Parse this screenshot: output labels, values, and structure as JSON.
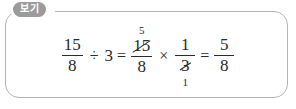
{
  "box": {
    "label": "보기",
    "border_color": "#b4b4b4",
    "badge_color": "#9b9b9b",
    "badge_text_color": "#ffffff",
    "background": "#ffffff"
  },
  "equation": {
    "full_text": "15/8 ÷ 3 = 15/8 × 1/3 = 5/8",
    "text_color": "#2b2b2b",
    "terms": {
      "f1": {
        "numerator": "15",
        "denominator": "8"
      },
      "op_divide": "÷",
      "divisor": "3",
      "op_equals_1": "=",
      "f2": {
        "numerator": "15",
        "denominator": "8",
        "cancel_numerator": true,
        "cancel_value_above": "5"
      },
      "op_multiply": "×",
      "f3": {
        "numerator": "1",
        "denominator": "3",
        "cancel_denominator": true,
        "cancel_value_below": "1"
      },
      "op_equals_2": "=",
      "f4": {
        "numerator": "5",
        "denominator": "8"
      }
    }
  }
}
